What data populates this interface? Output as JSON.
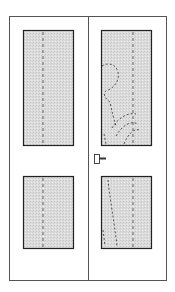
{
  "figure": {
    "colors": {
      "background": "#ffffff",
      "frame_line": "#555555",
      "glass_border": "#222222",
      "glass_fill": "#d8d8d8",
      "dash_line": "#444444",
      "handle": "#333333"
    },
    "panels": [
      {
        "name": "left-leaf",
        "glass": [
          "upper",
          "lower"
        ]
      },
      {
        "name": "right-leaf",
        "glass": [
          "upper",
          "lower"
        ],
        "has_handle": true
      }
    ]
  }
}
